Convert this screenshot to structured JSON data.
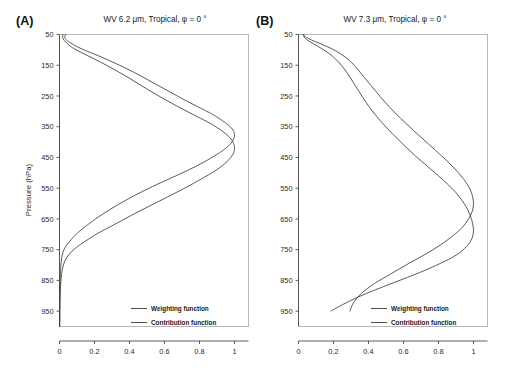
{
  "figure": {
    "background": "#ffffff",
    "curve_color": "#3c3c3c",
    "frame_color": "#b9b9b9",
    "axis_color": "#4a4a4a"
  },
  "panels": [
    {
      "tag": "(A)",
      "title": "WV 6.2  μm,  Tropical,  φ = 0 °",
      "ylabel": "Pressure (hPa)",
      "xlabel": "",
      "legend": [
        {
          "label": "Weighting function"
        },
        {
          "label": "Contribution function"
        }
      ]
    },
    {
      "tag": "(B)",
      "title": "WV 7.3  μm,  Tropical,  φ = 0 °",
      "ylabel": "",
      "xlabel": "",
      "legend": [
        {
          "label": "Weighting function"
        },
        {
          "label": "Contribution function"
        }
      ]
    }
  ],
  "chart_data": [
    {
      "type": "line",
      "title": "WV 6.2  μm,  Tropical,  φ = 0 °",
      "panel": "(A)",
      "xlabel": "",
      "ylabel": "Pressure (hPa)",
      "xlim": [
        0,
        1.08
      ],
      "ylim": [
        50,
        1000
      ],
      "y_inverted": true,
      "xticks": [
        0,
        0.2,
        0.4,
        0.6,
        0.8,
        1
      ],
      "xticklabels": [
        "0",
        "0.2",
        "0.4",
        "0.6",
        "0.8",
        "1"
      ],
      "yticks": [
        50,
        150,
        250,
        350,
        450,
        550,
        650,
        750,
        850,
        950
      ],
      "yticklabels": [
        "50",
        "150",
        "250",
        "350",
        "450",
        "550",
        "650",
        "750",
        "850",
        "950"
      ],
      "grid": false,
      "legend_position": "lower-right",
      "series": [
        {
          "name": "Weighting function",
          "pressure": [
            50,
            60,
            70,
            85,
            100,
            120,
            140,
            160,
            185,
            210,
            235,
            260,
            285,
            310,
            330,
            350,
            365,
            380,
            400,
            420,
            440,
            465,
            490,
            515,
            545,
            575,
            605,
            635,
            665,
            690,
            710,
            725,
            740,
            755,
            775,
            800,
            830,
            870,
            910,
            950,
            1000
          ],
          "value": [
            0.035,
            0.03,
            0.045,
            0.085,
            0.14,
            0.225,
            0.305,
            0.38,
            0.465,
            0.545,
            0.625,
            0.705,
            0.79,
            0.875,
            0.93,
            0.975,
            0.995,
            1.0,
            0.985,
            0.95,
            0.9,
            0.825,
            0.74,
            0.645,
            0.53,
            0.425,
            0.33,
            0.245,
            0.17,
            0.115,
            0.078,
            0.055,
            0.035,
            0.022,
            0.013,
            0.008,
            0.005,
            0.003,
            0.002,
            0.0015,
            0.001
          ]
        },
        {
          "name": "Contribution function",
          "pressure": [
            50,
            60,
            70,
            85,
            100,
            120,
            140,
            160,
            185,
            210,
            235,
            260,
            285,
            310,
            335,
            360,
            385,
            405,
            425,
            445,
            470,
            495,
            520,
            550,
            580,
            610,
            640,
            670,
            695,
            715,
            732,
            748,
            765,
            785,
            810,
            840,
            880,
            920,
            950,
            1000
          ],
          "pressure_note": "peak shifted lower than weighting function",
          "value": [
            0.02,
            0.018,
            0.028,
            0.055,
            0.095,
            0.165,
            0.235,
            0.3,
            0.378,
            0.45,
            0.522,
            0.598,
            0.678,
            0.762,
            0.848,
            0.92,
            0.972,
            0.995,
            1.0,
            0.985,
            0.945,
            0.885,
            0.81,
            0.715,
            0.612,
            0.508,
            0.405,
            0.308,
            0.225,
            0.168,
            0.122,
            0.085,
            0.055,
            0.032,
            0.018,
            0.01,
            0.005,
            0.003,
            0.002,
            0.001
          ]
        }
      ]
    },
    {
      "type": "line",
      "title": "WV 7.3  μm,  Tropical,  φ = 0 °",
      "panel": "(B)",
      "xlabel": "",
      "ylabel": "",
      "xlim": [
        0,
        1.08
      ],
      "ylim": [
        50,
        1000
      ],
      "y_inverted": true,
      "xticks": [
        0,
        0.2,
        0.4,
        0.6,
        0.8,
        1
      ],
      "xticklabels": [
        "0",
        "0.2",
        "0.4",
        "0.6",
        "0.8",
        "1"
      ],
      "yticks": [
        50,
        150,
        250,
        350,
        450,
        550,
        650,
        750,
        850,
        950
      ],
      "yticklabels": [
        "50",
        "150",
        "250",
        "350",
        "450",
        "550",
        "650",
        "750",
        "850",
        "950"
      ],
      "grid": false,
      "legend_position": "lower-right",
      "series": [
        {
          "name": "Weighting function",
          "pressure": [
            50,
            58,
            68,
            80,
            95,
            112,
            130,
            150,
            175,
            205,
            235,
            270,
            305,
            340,
            375,
            410,
            445,
            478,
            510,
            540,
            565,
            590,
            615,
            640,
            665,
            690,
            715,
            740,
            768,
            795,
            825,
            855,
            885,
            915,
            945,
            950
          ],
          "value": [
            0.03,
            0.032,
            0.05,
            0.085,
            0.13,
            0.175,
            0.212,
            0.245,
            0.278,
            0.312,
            0.345,
            0.385,
            0.43,
            0.482,
            0.54,
            0.602,
            0.668,
            0.735,
            0.8,
            0.858,
            0.9,
            0.935,
            0.962,
            0.982,
            0.995,
            1.0,
            0.99,
            0.96,
            0.9,
            0.81,
            0.69,
            0.555,
            0.42,
            0.3,
            0.2,
            0.185
          ]
        },
        {
          "name": "Contribution function",
          "pressure": [
            50,
            58,
            68,
            80,
            95,
            112,
            130,
            150,
            175,
            205,
            235,
            270,
            305,
            340,
            375,
            410,
            445,
            478,
            505,
            532,
            556,
            578,
            600,
            625,
            650,
            678,
            705,
            735,
            765,
            795,
            828,
            860,
            892,
            922,
            948,
            950
          ],
          "value": [
            0.025,
            0.04,
            0.075,
            0.125,
            0.185,
            0.238,
            0.282,
            0.318,
            0.355,
            0.398,
            0.442,
            0.494,
            0.552,
            0.615,
            0.682,
            0.75,
            0.818,
            0.878,
            0.922,
            0.958,
            0.982,
            0.995,
            1.0,
            0.993,
            0.972,
            0.935,
            0.882,
            0.81,
            0.725,
            0.63,
            0.53,
            0.435,
            0.36,
            0.315,
            0.295,
            0.295
          ]
        }
      ]
    }
  ]
}
